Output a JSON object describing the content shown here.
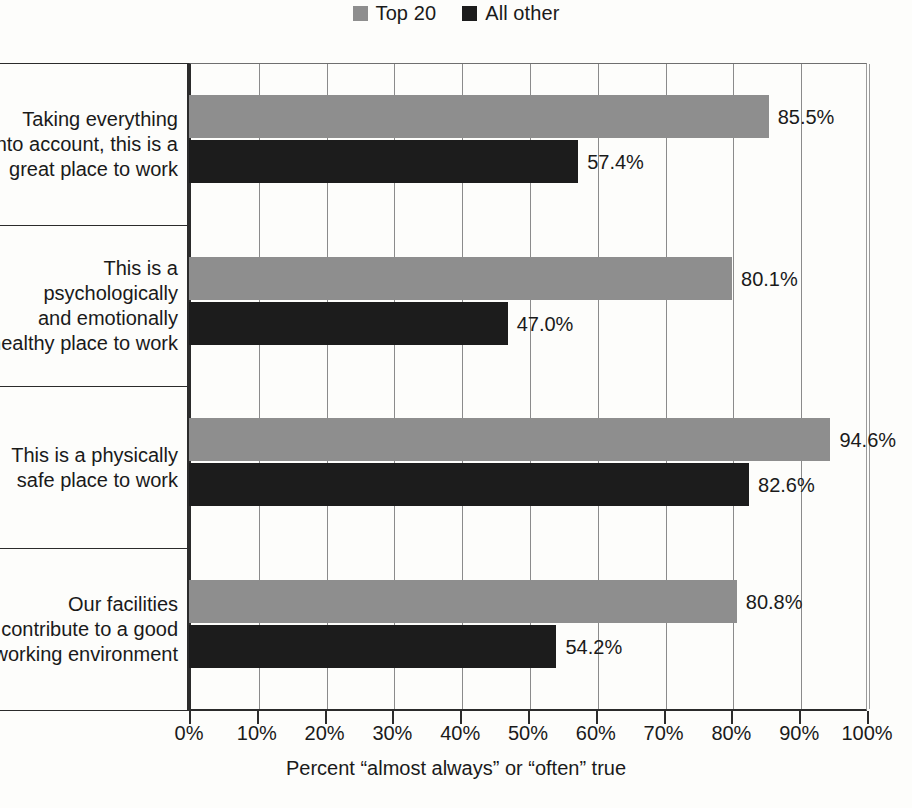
{
  "chart_data": {
    "type": "bar",
    "orientation": "horizontal",
    "title": "",
    "xlabel": "Percent “almost always” or “often” true",
    "ylabel": "",
    "xlim": [
      0,
      100
    ],
    "xtick_labels": [
      "0%",
      "10%",
      "20%",
      "30%",
      "40%",
      "50%",
      "60%",
      "70%",
      "80%",
      "90%",
      "100%"
    ],
    "xtick_values": [
      0,
      10,
      20,
      30,
      40,
      50,
      60,
      70,
      80,
      90,
      100
    ],
    "grid": true,
    "legend_position": "top-center",
    "categories": [
      "Taking everything\ninto account, this is a\ngreat place to work",
      "This is a\npsychologically\nand emotionally\nhealthy place to work",
      "This is a physically\nsafe place to work",
      "Our facilities\ncontribute to a good\nworking environment"
    ],
    "series": [
      {
        "name": "Top 20",
        "color": "#8e8e8e",
        "values": [
          85.5,
          80.1,
          94.6,
          80.8
        ],
        "value_labels": [
          "85.5%",
          "80.1%",
          "94.6%",
          "80.8%"
        ]
      },
      {
        "name": "All other",
        "color": "#1c1c1c",
        "values": [
          57.4,
          47.0,
          82.6,
          54.2
        ],
        "value_labels": [
          "57.4%",
          "47.0%",
          "82.6%",
          "54.2%"
        ]
      }
    ]
  },
  "legend": {
    "items": [
      {
        "label": "Top 20",
        "color": "#8e8e8e"
      },
      {
        "label": "All other",
        "color": "#1c1c1c"
      }
    ]
  },
  "axis": {
    "x_title": "Percent “almost always” or “often” true"
  }
}
